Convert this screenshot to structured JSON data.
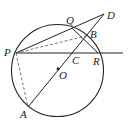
{
  "diagram": {
    "type": "geometry",
    "circle": {
      "center": "O",
      "cx": 57.5,
      "cy": 70.5,
      "r": 46
    },
    "points": {
      "P": {
        "x": 16,
        "y": 53,
        "label": "P"
      },
      "Q": {
        "x": 72,
        "y": 28,
        "label": "Q"
      },
      "B": {
        "x": 86,
        "y": 36,
        "label": "B"
      },
      "D": {
        "x": 104,
        "y": 14,
        "label": "D"
      },
      "C": {
        "x": 71,
        "y": 53,
        "label": "C"
      },
      "R": {
        "x": 98,
        "y": 53,
        "label": "R"
      },
      "O": {
        "x": 58,
        "y": 69,
        "label": "O"
      },
      "A": {
        "x": 28,
        "y": 107,
        "label": "A"
      }
    },
    "solid_segments": [
      "P-D",
      "A-D",
      "P-line through C and R",
      "Q-R"
    ],
    "dashed_segments": [
      "P-B",
      "P-A"
    ]
  }
}
